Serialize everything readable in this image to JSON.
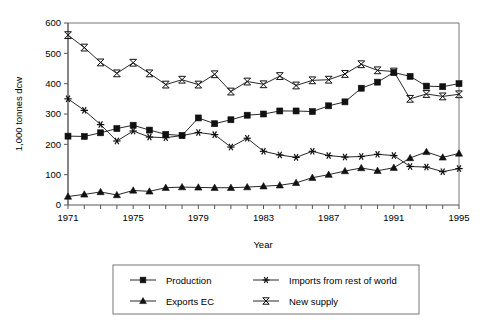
{
  "chart_data": {
    "type": "line",
    "title": "",
    "xlabel": "Year",
    "ylabel": "1,000 tonnes dcw",
    "xlim": [
      1971,
      1995
    ],
    "ylim": [
      0,
      600
    ],
    "ytick_step": 100,
    "xtick_step": 1,
    "xlabel_step": 4,
    "grid": false,
    "legend_position": "bottom",
    "x": [
      1971,
      1972,
      1973,
      1974,
      1975,
      1976,
      1977,
      1978,
      1979,
      1980,
      1981,
      1982,
      1983,
      1984,
      1985,
      1986,
      1987,
      1988,
      1989,
      1990,
      1991,
      1992,
      1993,
      1994,
      1995
    ],
    "xticklabels": [
      "1971",
      "1975",
      "1979",
      "1983",
      "1987",
      "1991",
      "1995"
    ],
    "yticklabels": [
      "0",
      "100",
      "200",
      "300",
      "400",
      "500",
      "600"
    ],
    "series": [
      {
        "name": "Production",
        "marker": "square",
        "values": [
          227,
          226,
          238,
          252,
          263,
          247,
          233,
          229,
          287,
          268,
          281,
          296,
          300,
          310,
          310,
          308,
          327,
          340,
          385,
          405,
          437,
          424,
          392,
          390,
          400
        ]
      },
      {
        "name": "Imports from rest of world",
        "marker": "asterisk",
        "values": [
          350,
          312,
          265,
          211,
          244,
          224,
          222,
          229,
          239,
          232,
          191,
          220,
          177,
          165,
          157,
          177,
          163,
          158,
          160,
          167,
          163,
          127,
          125,
          110,
          120
        ]
      },
      {
        "name": "Exports EC",
        "marker": "triangle",
        "values": [
          28,
          35,
          43,
          33,
          48,
          45,
          57,
          59,
          58,
          57,
          57,
          59,
          62,
          65,
          73,
          90,
          100,
          112,
          122,
          113,
          123,
          155,
          175,
          157,
          170
        ]
      },
      {
        "name": "New supply",
        "marker": "bowtie",
        "values": [
          560,
          519,
          470,
          434,
          469,
          434,
          397,
          413,
          397,
          431,
          374,
          407,
          398,
          425,
          394,
          411,
          413,
          432,
          464,
          444,
          440,
          350,
          366,
          358,
          365
        ]
      }
    ]
  },
  "legend": {
    "entries": [
      {
        "label": "Production"
      },
      {
        "label": "Imports from rest of world"
      },
      {
        "label": "Exports EC"
      },
      {
        "label": "New supply"
      }
    ]
  }
}
